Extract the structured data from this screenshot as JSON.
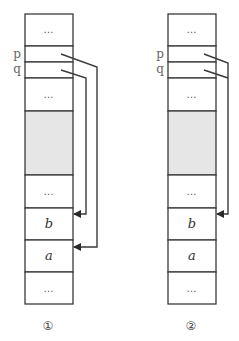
{
  "diagrams": [
    {
      "caption": "①",
      "pointer_labels": {
        "p": "p",
        "q": "q"
      },
      "cells": [
        {
          "type": "text",
          "text": "…"
        },
        {
          "type": "pointer",
          "text": ""
        },
        {
          "type": "pointer",
          "text": ""
        },
        {
          "type": "text",
          "text": "…"
        },
        {
          "type": "shaded",
          "text": ""
        },
        {
          "type": "text",
          "text": "…"
        },
        {
          "type": "var",
          "text": "b"
        },
        {
          "type": "var",
          "text": "a"
        },
        {
          "type": "text",
          "text": "…"
        }
      ],
      "arrows": [
        {
          "from": "p",
          "to": "a"
        },
        {
          "from": "q",
          "to": "b"
        }
      ]
    },
    {
      "caption": "②",
      "pointer_labels": {
        "p": "p",
        "q": "q"
      },
      "cells": [
        {
          "type": "text",
          "text": "…"
        },
        {
          "type": "pointer",
          "text": ""
        },
        {
          "type": "pointer",
          "text": ""
        },
        {
          "type": "text",
          "text": "…"
        },
        {
          "type": "shaded",
          "text": ""
        },
        {
          "type": "text",
          "text": "…"
        },
        {
          "type": "var",
          "text": "b"
        },
        {
          "type": "var",
          "text": "a"
        },
        {
          "type": "text",
          "text": "…"
        }
      ],
      "arrows": [
        {
          "from": "p",
          "to": "b"
        },
        {
          "from": "q",
          "to": "b"
        }
      ]
    }
  ],
  "colors": {
    "stroke": "#3a3a3a",
    "shade": "#e6e6e6",
    "background": "#ffffff"
  }
}
